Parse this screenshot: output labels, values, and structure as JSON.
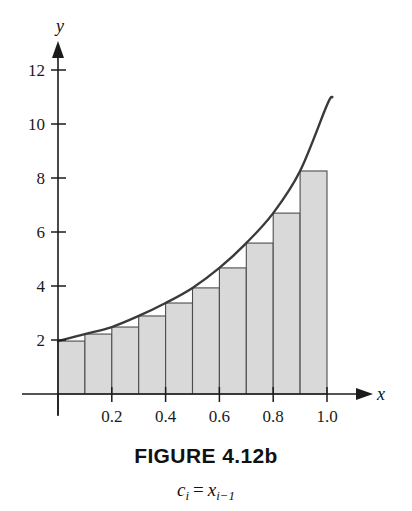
{
  "figure": {
    "caption": "FIGURE 4.12b",
    "subcaption_c": "c",
    "subcaption_c_sub": "i",
    "subcaption_eq": "=",
    "subcaption_x": "x",
    "subcaption_x_sub": "i−1",
    "subcaption_plain": "c_i = x_{i-1}"
  },
  "axes": {
    "x_label": "x",
    "y_label": "y",
    "x_ticks": [
      {
        "label": "0.2",
        "value": 0.2
      },
      {
        "label": "0.4",
        "value": 0.4
      },
      {
        "label": "0.6",
        "value": 0.6
      },
      {
        "label": "0.8",
        "value": 0.8
      },
      {
        "label": "1.0",
        "value": 1.0
      }
    ],
    "y_ticks": [
      {
        "label": "2",
        "value": 2
      },
      {
        "label": "4",
        "value": 4
      },
      {
        "label": "6",
        "value": 6
      },
      {
        "label": "8",
        "value": 8
      },
      {
        "label": "10",
        "value": 10
      },
      {
        "label": "12",
        "value": 12
      }
    ],
    "xlim": [
      0,
      1.15
    ],
    "ylim": [
      0,
      13
    ]
  },
  "style": {
    "curve_color": "#3a3a3a",
    "axis_color": "#1b1b1b",
    "bar_fill": "#d9d9d9",
    "bar_stroke": "#4d4d4d",
    "background": "#ffffff"
  },
  "chart_data": {
    "type": "bar",
    "title": "FIGURE 4.12b",
    "subtitle": "c_i = x_{i-1}",
    "xlabel": "x",
    "ylabel": "y",
    "grid": false,
    "legend": null,
    "xlim": [
      0,
      1.15
    ],
    "ylim": [
      0,
      13
    ],
    "xticks": [
      0.2,
      0.4,
      0.6,
      0.8,
      1.0
    ],
    "yticks": [
      2,
      4,
      6,
      8,
      10,
      12
    ],
    "bar_left_edges": [
      0.0,
      0.1,
      0.2,
      0.3,
      0.4,
      0.5,
      0.6,
      0.7,
      0.8,
      0.9
    ],
    "bar_width": 0.1,
    "categories": [
      "0.0",
      "0.1",
      "0.2",
      "0.3",
      "0.4",
      "0.5",
      "0.6",
      "0.7",
      "0.8",
      "0.9"
    ],
    "values": [
      1.96,
      2.22,
      2.48,
      2.89,
      3.37,
      3.93,
      4.67,
      5.59,
      6.7,
      8.26
    ],
    "series": [
      {
        "name": "curve",
        "type": "line",
        "x": [
          0.0,
          0.1,
          0.2,
          0.3,
          0.4,
          0.5,
          0.6,
          0.7,
          0.8,
          0.9,
          1.0,
          1.02
        ],
        "y": [
          1.96,
          2.22,
          2.48,
          2.89,
          3.37,
          3.93,
          4.67,
          5.59,
          6.7,
          8.26,
          10.7,
          11.0
        ]
      }
    ]
  }
}
